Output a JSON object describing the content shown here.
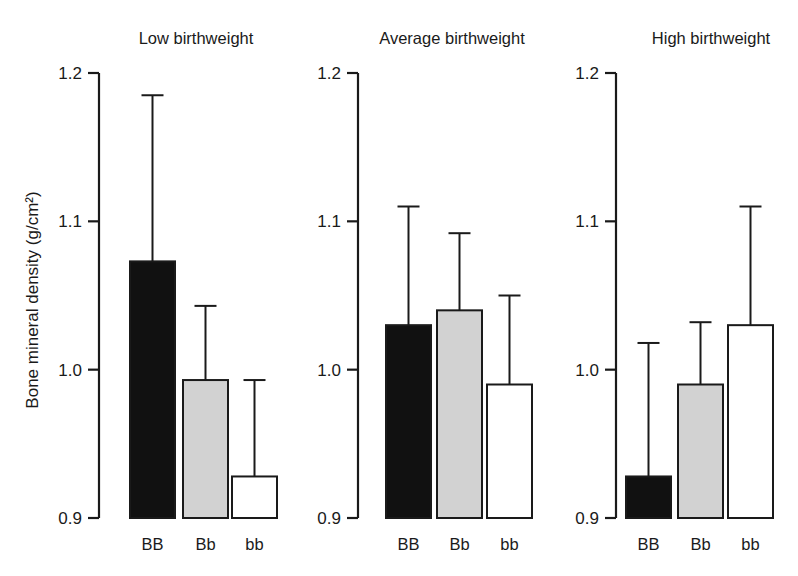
{
  "figure": {
    "background_color": "#ffffff",
    "foreground_color": "#1a1a1a"
  },
  "axis": {
    "ylabel": "Bone mineral density (g/cm²)",
    "tick_labels": [
      "1.2",
      "1.1",
      "1.0",
      "0.9"
    ],
    "tick_values": [
      1.2,
      1.1,
      1.0,
      0.9
    ]
  },
  "panels": [
    {
      "title": "Low birthweight",
      "categories": [
        "BB",
        "Bb",
        "bb"
      ]
    },
    {
      "title": "Average birthweight",
      "categories": [
        "BB",
        "Bb",
        "bb"
      ]
    },
    {
      "title": "High birthweight",
      "categories": [
        "BB",
        "Bb",
        "bb"
      ]
    }
  ],
  "series_styles": [
    {
      "name": "BB",
      "fill": "#111111",
      "label": "BB"
    },
    {
      "name": "Bb",
      "fill": "#d2d2d2",
      "label": "Bb"
    },
    {
      "name": "bb",
      "fill": "#ffffff",
      "label": "bb"
    }
  ],
  "chart_data": {
    "type": "bar",
    "title": "",
    "xlabel": "",
    "ylabel": "Bone mineral density (g/cm²)",
    "ylim": [
      0.9,
      1.2
    ],
    "yticks": [
      0.9,
      1.0,
      1.1,
      1.2
    ],
    "grid": false,
    "legend_position": "none",
    "categories": [
      "BB",
      "Bb",
      "bb"
    ],
    "panels": [
      {
        "name": "Low birthweight",
        "categories": [
          "BB",
          "Bb",
          "bb"
        ],
        "values": [
          1.073,
          0.993,
          0.928
        ],
        "error_upper": [
          1.185,
          1.043,
          0.993
        ],
        "fills": [
          "#111111",
          "#d2d2d2",
          "#ffffff"
        ]
      },
      {
        "name": "Average birthweight",
        "categories": [
          "BB",
          "Bb",
          "bb"
        ],
        "values": [
          1.03,
          1.04,
          0.99
        ],
        "error_upper": [
          1.11,
          1.092,
          1.05
        ],
        "fills": [
          "#111111",
          "#d2d2d2",
          "#ffffff"
        ]
      },
      {
        "name": "High birthweight",
        "categories": [
          "BB",
          "Bb",
          "bb"
        ],
        "values": [
          0.928,
          0.99,
          1.03
        ],
        "error_upper": [
          1.018,
          1.032,
          1.11
        ],
        "fills": [
          "#111111",
          "#d2d2d2",
          "#ffffff"
        ]
      }
    ]
  }
}
